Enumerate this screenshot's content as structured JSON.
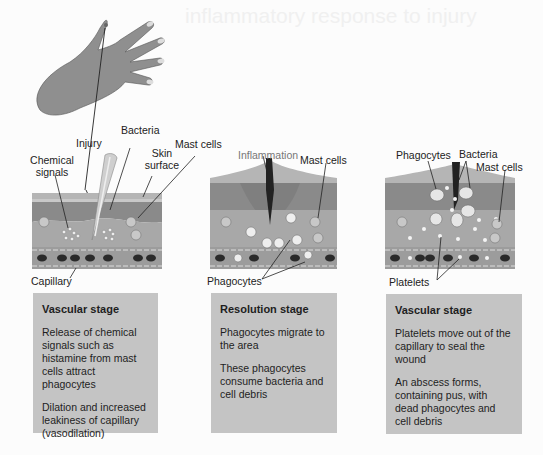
{
  "background_ghost_text": "inflammatory response to injury",
  "colors": {
    "skin_top": "#b0b0b0",
    "skin_dermis": "#8a8a8a",
    "tissue": "#a9a9a9",
    "capillary": "#9c9c9c",
    "box": "#c4c4c4",
    "hand": "#8f8f8f"
  },
  "panels": [
    {
      "labels": {
        "injury": "Injury",
        "bacteria": "Bacteria",
        "chemical_signals": "Chemical signals",
        "skin_surface": "Skin surface",
        "mast_cells": "Mast cells",
        "capillary": "Capillary"
      },
      "box": {
        "title": "Vascular stage",
        "paragraphs": [
          "Release of chemical signals such as histamine from mast cells attract phagocytes",
          "Dilation and increased leakiness of capillary (vasodilation)"
        ]
      }
    },
    {
      "labels": {
        "inflammation": "Inflammation",
        "mast_cells": "Mast cells",
        "phagocytes": "Phagocytes"
      },
      "box": {
        "title": "Resolution stage",
        "paragraphs": [
          "Phagocytes migrate to the area",
          "These phagocytes consume bacteria and cell debris"
        ]
      }
    },
    {
      "labels": {
        "phagocytes": "Phagocytes",
        "bacteria": "Bacteria",
        "mast_cells": "Mast cells",
        "platelets": "Platelets"
      },
      "box": {
        "title": "Vascular stage",
        "paragraphs": [
          "Platelets move out of the capillary to seal the wound",
          "An abscess forms, containing pus, with dead phagocytes and cell debris"
        ]
      }
    }
  ]
}
